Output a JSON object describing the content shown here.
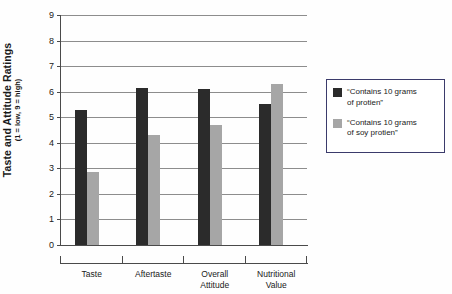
{
  "chart_data": {
    "type": "bar",
    "title": "",
    "subtitle": "",
    "xlabel": "",
    "ylabel": "Taste and Attitude Ratings",
    "ylabel_note": "(1 = low, 9 = high)",
    "categories": [
      "Taste",
      "Aftertaste",
      "Overall\nAttitude",
      "Nutritional\nValue"
    ],
    "series": [
      {
        "name": "“Contains 10 grams of protien”",
        "legend_line1": "“Contains 10 grams",
        "legend_line2": "of protien”",
        "color": "#2b2b2b",
        "values": [
          5.3,
          6.15,
          6.1,
          5.5
        ]
      },
      {
        "name": "“Contains 10 grams of soy protien”",
        "legend_line1": "“Contains 10 grams",
        "legend_line2": "of soy protien”",
        "color": "#a6a6a6",
        "values": [
          2.85,
          4.3,
          4.68,
          6.3
        ]
      }
    ],
    "ylim": [
      0,
      9
    ],
    "ytick_labels": [
      "0",
      "1",
      "2",
      "3",
      "4",
      "5",
      "6",
      "7",
      "8",
      "9"
    ],
    "ytick_values": [
      0,
      1,
      2,
      3,
      4,
      5,
      6,
      7,
      8,
      9
    ],
    "grid": true,
    "grid_axis": "y",
    "legend_position": "right",
    "legend_border_color": "#3b3b6b",
    "background_color": "#fefefe",
    "axis_color": "#4a4a4a",
    "gridline_color": "#8d8d8d"
  }
}
